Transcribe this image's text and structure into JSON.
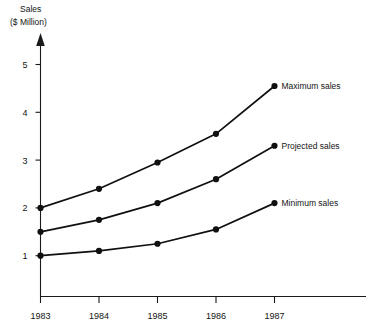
{
  "chart_data": {
    "type": "line",
    "title": "",
    "ylabel": "Sales\n($ Million)",
    "ylabel_line1": "Sales",
    "ylabel_line2": "($ Million)",
    "xlabel": "",
    "categories": [
      "1983",
      "1984",
      "1985",
      "1986",
      "1987"
    ],
    "x": [
      1983,
      1984,
      1985,
      1986,
      1987
    ],
    "xtick_labels": [
      "1983",
      "1984",
      "1985",
      "1986",
      "1987"
    ],
    "ytick_labels": [
      "1",
      "2",
      "3",
      "4",
      "5"
    ],
    "yticks": [
      1,
      2,
      3,
      4,
      5
    ],
    "ylim": [
      0,
      5.4
    ],
    "xlim": [
      1983,
      1987.6
    ],
    "grid": false,
    "legend_position": "right-inline-annotations",
    "marker": "filled-circle",
    "series": [
      {
        "name": "Maximum sales",
        "label": "Maximum sales",
        "values": [
          2.0,
          2.4,
          2.95,
          3.55,
          4.55
        ],
        "color": "#101010"
      },
      {
        "name": "Projected sales",
        "label": "Projected sales",
        "values": [
          1.5,
          1.75,
          2.1,
          2.6,
          3.3
        ],
        "color": "#101010"
      },
      {
        "name": "Minimum sales",
        "label": "Minimum sales",
        "values": [
          1.0,
          1.1,
          1.25,
          1.55,
          2.1
        ],
        "color": "#101010"
      }
    ],
    "annotations": [
      {
        "text": "Maximum sales",
        "series": "Maximum sales",
        "at_x": "1987"
      },
      {
        "text": "Projected sales",
        "series": "Projected sales",
        "at_x": "1987"
      },
      {
        "text": "Minimum sales",
        "series": "Minimum sales",
        "at_x": "1987"
      }
    ]
  }
}
